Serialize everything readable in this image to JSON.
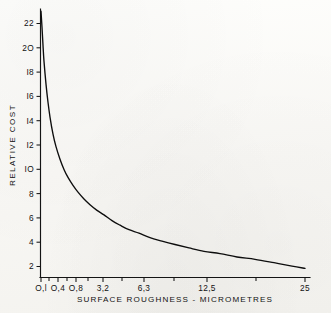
{
  "figure": {
    "background_color": "#fbfbf9",
    "ink_color": "#0d0d0d"
  },
  "chart_data": {
    "type": "line",
    "title": "",
    "xlabel": "SURFACE ROUGHNESS - MICROMETRES",
    "ylabel": "RELATIVE COST",
    "grid": false,
    "legend": "none",
    "x_scale": "non-linear (roughness grade steps)",
    "xtick_labels": [
      "O,l",
      "O,4",
      "O,8",
      "3,2",
      "6,3",
      "12,5",
      "25"
    ],
    "xtick_values": [
      0.1,
      0.4,
      0.8,
      3.2,
      6.3,
      12.5,
      25
    ],
    "xtick_positions_px": [
      41,
      58,
      76,
      103,
      144,
      207,
      305
    ],
    "extra_xtick_positions_px": [
      49,
      67,
      88,
      122,
      174,
      256
    ],
    "ytick_labels": [
      "2",
      "4",
      "6",
      "8",
      "IO",
      "I2",
      "I4",
      "I6",
      "I8",
      "2O",
      "22"
    ],
    "ytick_values": [
      2,
      4,
      6,
      8,
      10,
      12,
      14,
      16,
      18,
      20,
      22
    ],
    "ylim": [
      0,
      23.6
    ],
    "xlim_px": [
      40,
      310
    ],
    "series": [
      {
        "name": "Relative cost",
        "x_px": [
          41,
          42,
          43,
          44,
          46,
          48,
          50,
          53,
          56,
          60,
          64,
          68,
          73,
          78,
          84,
          90,
          97,
          104,
          112,
          120,
          129,
          139,
          150,
          162,
          175,
          189,
          204,
          220,
          237,
          255,
          274,
          292,
          305
        ],
        "values": [
          23.4,
          22.0,
          20.4,
          19.0,
          17.0,
          15.4,
          14.1,
          12.6,
          11.5,
          10.4,
          9.5,
          8.8,
          8.1,
          7.5,
          6.9,
          6.4,
          5.9,
          5.5,
          5.0,
          4.6,
          4.2,
          3.9,
          3.5,
          3.2,
          2.9,
          2.6,
          2.3,
          2.1,
          1.8,
          1.6,
          1.3,
          1.0,
          0.8
        ]
      }
    ],
    "annotations": []
  },
  "axes": {
    "y_title": "RELATIVE COST",
    "x_title": "SURFACE ROUGHNESS - MICROMETRES"
  }
}
